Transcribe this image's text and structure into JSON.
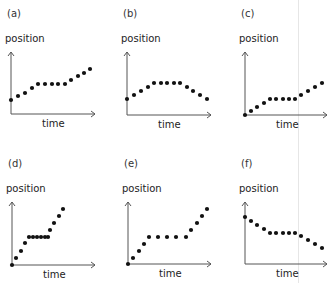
{
  "figure": {
    "panels": [
      {
        "id": "a",
        "label": "(a)",
        "ylabel": "position",
        "xlabel": "time"
      },
      {
        "id": "b",
        "label": "(b)",
        "ylabel": "position",
        "xlabel": "time"
      },
      {
        "id": "c",
        "label": "(c)",
        "ylabel": "position",
        "xlabel": "time"
      },
      {
        "id": "d",
        "label": "(d)",
        "ylabel": "position",
        "xlabel": "time"
      },
      {
        "id": "e",
        "label": "(e)",
        "ylabel": "position",
        "xlabel": "time"
      },
      {
        "id": "f",
        "label": "(f)",
        "ylabel": "position",
        "xlabel": "time"
      }
    ],
    "colors": {
      "dots": "#111111",
      "axes": "#555555",
      "text": "#222222",
      "guide": "#e6e6e6"
    }
  },
  "chart_data": [
    {
      "type": "scatter",
      "title": "(a)",
      "xlabel": "time",
      "ylabel": "position",
      "x": [
        0,
        1,
        2,
        3,
        4,
        5,
        6,
        7,
        8,
        9,
        10,
        11,
        12
      ],
      "y": [
        2.4,
        2.9,
        3.3,
        4.0,
        4.5,
        4.5,
        4.5,
        4.5,
        4.5,
        5.0,
        5.6,
        6.0,
        6.6
      ]
    },
    {
      "type": "scatter",
      "title": "(b)",
      "xlabel": "time",
      "ylabel": "position",
      "x": [
        0,
        1,
        2,
        3,
        4,
        5,
        6,
        7,
        8,
        9,
        10,
        11,
        12
      ],
      "y": [
        2.4,
        2.9,
        3.5,
        4.0,
        4.5,
        4.5,
        4.5,
        4.5,
        4.5,
        4.0,
        3.5,
        2.9,
        2.4
      ]
    },
    {
      "type": "scatter",
      "title": "(c)",
      "xlabel": "time",
      "ylabel": "position",
      "x": [
        0,
        1,
        2,
        3,
        4,
        5,
        6,
        7,
        8,
        9,
        10,
        11,
        12
      ],
      "y": [
        0,
        0.5,
        1.1,
        1.6,
        2.1,
        2.1,
        2.1,
        2.1,
        2.1,
        2.7,
        3.2,
        3.7,
        4.3
      ]
    },
    {
      "type": "scatter",
      "title": "(d)",
      "xlabel": "time",
      "ylabel": "position",
      "x": [
        0,
        1,
        2,
        3,
        4,
        5,
        6,
        7,
        8,
        9,
        10,
        11,
        12,
        13
      ],
      "y": [
        0,
        0.9,
        1.9,
        2.9,
        3.7,
        3.7,
        3.7,
        3.7,
        3.7,
        3.7,
        4.6,
        5.6,
        6.5,
        7.5
      ]
    },
    {
      "type": "scatter",
      "title": "(e)",
      "xlabel": "time",
      "ylabel": "position",
      "x": [
        0,
        1,
        2,
        3,
        4,
        5,
        6,
        7,
        8,
        9,
        10,
        11,
        12
      ],
      "y": [
        0,
        0.8,
        1.7,
        2.7,
        3.6,
        3.6,
        3.6,
        3.6,
        3.6,
        4.5,
        5.5,
        6.4,
        7.3
      ]
    },
    {
      "type": "scatter",
      "title": "(f)",
      "xlabel": "time",
      "ylabel": "position",
      "x": [
        0,
        1,
        2,
        3,
        4,
        5,
        6,
        7,
        8,
        9,
        10,
        11,
        12
      ],
      "y": [
        6.2,
        5.7,
        5.2,
        4.7,
        4.1,
        4.1,
        4.1,
        4.1,
        4.1,
        3.7,
        3.2,
        2.7,
        2.1
      ]
    }
  ],
  "layout": {
    "panels": [
      {
        "left": 0,
        "top": 0,
        "axisX": 11,
        "axisTop": 52,
        "base": 114,
        "axisRight": 95,
        "pts": [
          [
            11,
            100
          ],
          [
            18,
            96
          ],
          [
            25,
            93
          ],
          [
            32,
            88
          ],
          [
            38,
            84
          ],
          [
            45,
            84
          ],
          [
            52,
            84
          ],
          [
            58,
            84
          ],
          [
            65,
            84
          ],
          [
            71,
            80
          ],
          [
            78,
            76
          ],
          [
            84,
            73
          ],
          [
            90,
            69
          ]
        ]
      },
      {
        "left": 110,
        "top": 0,
        "axisX": 127,
        "axisTop": 52,
        "base": 115,
        "axisRight": 211,
        "pts": [
          [
            127,
            99
          ],
          [
            134,
            95
          ],
          [
            141,
            91
          ],
          [
            148,
            87
          ],
          [
            154,
            83
          ],
          [
            161,
            83
          ],
          [
            167,
            83
          ],
          [
            174,
            83
          ],
          [
            180,
            83
          ],
          [
            187,
            87
          ],
          [
            193,
            91
          ],
          [
            200,
            95
          ],
          [
            207,
            99
          ]
        ]
      },
      {
        "left": 218,
        "top": 0,
        "axisX": 245,
        "axisTop": 52,
        "base": 115,
        "axisRight": 327,
        "pts": [
          [
            245,
            115
          ],
          [
            251,
            111
          ],
          [
            257,
            107
          ],
          [
            264,
            103
          ],
          [
            270,
            99
          ],
          [
            276,
            99
          ],
          [
            283,
            99
          ],
          [
            289,
            99
          ],
          [
            295,
            99
          ],
          [
            301,
            95
          ],
          [
            308,
            91
          ],
          [
            315,
            87
          ],
          [
            322,
            83
          ]
        ]
      },
      {
        "left": 0,
        "top": 141,
        "axisX": 12,
        "axisTop": 202,
        "base": 265,
        "axisRight": 95,
        "pts": [
          [
            12,
            265
          ],
          [
            16,
            258
          ],
          [
            21,
            251
          ],
          [
            25,
            243
          ],
          [
            29,
            237
          ],
          [
            33,
            237
          ],
          [
            37,
            237
          ],
          [
            41,
            237
          ],
          [
            45,
            237
          ],
          [
            48,
            237
          ],
          [
            50,
            230
          ],
          [
            54,
            223
          ],
          [
            59,
            216
          ],
          [
            63,
            209
          ]
        ]
      },
      {
        "left": 110,
        "top": 141,
        "axisX": 128,
        "axisTop": 202,
        "base": 264,
        "axisRight": 211,
        "pts": [
          [
            128,
            264
          ],
          [
            133,
            258
          ],
          [
            139,
            251
          ],
          [
            144,
            244
          ],
          [
            149,
            237
          ],
          [
            158,
            237
          ],
          [
            167,
            237
          ],
          [
            176,
            237
          ],
          [
            186,
            237
          ],
          [
            191,
            230
          ],
          [
            197,
            223
          ],
          [
            202,
            216
          ],
          [
            207,
            209
          ]
        ]
      },
      {
        "left": 218,
        "top": 141,
        "axisX": 245,
        "axisTop": 202,
        "base": 264,
        "axisRight": 327,
        "pts": [
          [
            245,
            217
          ],
          [
            251,
            221
          ],
          [
            257,
            225
          ],
          [
            264,
            229
          ],
          [
            270,
            233
          ],
          [
            276,
            233
          ],
          [
            283,
            233
          ],
          [
            289,
            233
          ],
          [
            295,
            233
          ],
          [
            301,
            236
          ],
          [
            308,
            240
          ],
          [
            315,
            244
          ],
          [
            322,
            248
          ]
        ]
      }
    ]
  }
}
